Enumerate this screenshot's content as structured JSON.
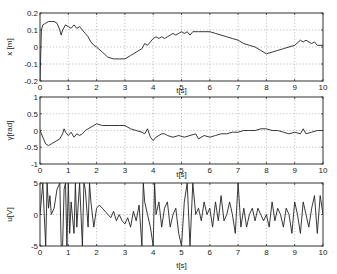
{
  "chart_data": [
    {
      "type": "line",
      "title": "",
      "xlabel": "t[s]",
      "ylabel": "x [m]",
      "xlim": [
        0,
        10
      ],
      "ylim": [
        -0.2,
        0.2
      ],
      "xticks": [
        0,
        1,
        2,
        3,
        4,
        5,
        6,
        7,
        8,
        9,
        10
      ],
      "yticks": [
        -0.2,
        -0.1,
        0,
        0.1,
        0.2
      ],
      "ytick_labels": [
        "-0.2",
        "-0.1",
        "0",
        "0.1",
        "0.2"
      ],
      "grid": true,
      "series": [
        {
          "name": "x",
          "x": [
            0,
            0.05,
            0.1,
            0.2,
            0.3,
            0.4,
            0.5,
            0.6,
            0.7,
            0.75,
            0.8,
            0.9,
            1.0,
            1.1,
            1.2,
            1.3,
            1.4,
            1.5,
            1.6,
            1.7,
            1.8,
            1.9,
            2.0,
            2.2,
            2.4,
            2.6,
            2.8,
            3.0,
            3.2,
            3.4,
            3.6,
            3.7,
            3.8,
            3.9,
            4.0,
            4.1,
            4.2,
            4.3,
            4.4,
            4.5,
            4.6,
            4.7,
            4.8,
            4.9,
            5.0,
            5.1,
            5.2,
            5.3,
            5.4,
            5.6,
            5.8,
            6.0,
            6.2,
            6.4,
            6.6,
            6.8,
            7.0,
            7.2,
            7.4,
            7.6,
            7.8,
            8.0,
            8.2,
            8.4,
            8.6,
            8.8,
            9.0,
            9.2,
            9.3,
            9.4,
            9.6,
            9.7,
            9.8,
            10.0
          ],
          "values": [
            -0.2,
            0.1,
            0.13,
            0.14,
            0.15,
            0.15,
            0.15,
            0.14,
            0.1,
            0.07,
            0.1,
            0.13,
            0.12,
            0.11,
            0.13,
            0.11,
            0.12,
            0.1,
            0.08,
            0.06,
            0.03,
            0.01,
            0.0,
            -0.03,
            -0.06,
            -0.07,
            -0.07,
            -0.07,
            -0.05,
            -0.03,
            -0.01,
            0.02,
            0.01,
            0.03,
            0.05,
            0.06,
            0.05,
            0.06,
            0.05,
            0.06,
            0.07,
            0.08,
            0.07,
            0.08,
            0.09,
            0.08,
            0.09,
            0.07,
            0.09,
            0.09,
            0.09,
            0.09,
            0.08,
            0.07,
            0.06,
            0.05,
            0.04,
            0.02,
            0.01,
            0.0,
            -0.02,
            -0.04,
            -0.03,
            -0.02,
            -0.01,
            0.0,
            0.01,
            0.04,
            0.03,
            0.04,
            0.02,
            0.03,
            0.01,
            0.01
          ]
        }
      ]
    },
    {
      "type": "line",
      "title": "",
      "xlabel": "t[s]",
      "ylabel": "γ[rad]",
      "xlim": [
        0,
        10
      ],
      "ylim": [
        -1,
        1
      ],
      "xticks": [
        0,
        1,
        2,
        3,
        4,
        5,
        6,
        7,
        8,
        9,
        10
      ],
      "yticks": [
        -1,
        -0.5,
        0,
        0.5,
        1
      ],
      "ytick_labels": [
        "-1",
        "-0.5",
        "0",
        "0.5",
        "1"
      ],
      "grid": true,
      "series": [
        {
          "name": "gamma",
          "x": [
            0,
            0.1,
            0.2,
            0.3,
            0.4,
            0.5,
            0.6,
            0.7,
            0.8,
            0.85,
            0.9,
            1.0,
            1.1,
            1.2,
            1.3,
            1.4,
            1.5,
            1.6,
            1.7,
            1.8,
            1.9,
            2.0,
            2.2,
            2.5,
            2.8,
            3.0,
            3.2,
            3.4,
            3.6,
            3.7,
            3.8,
            3.9,
            4.0,
            4.1,
            4.2,
            4.3,
            4.4,
            4.5,
            4.7,
            4.9,
            5.1,
            5.3,
            5.5,
            5.6,
            5.8,
            6.0,
            6.2,
            6.4,
            6.6,
            6.8,
            7.0,
            7.2,
            7.4,
            7.6,
            7.8,
            8.0,
            8.2,
            8.4,
            8.6,
            8.8,
            9.0,
            9.2,
            9.3,
            9.4,
            9.6,
            9.8,
            10.0
          ],
          "values": [
            0.0,
            -0.2,
            -0.4,
            -0.45,
            -0.4,
            -0.35,
            -0.3,
            -0.25,
            -0.1,
            0.05,
            -0.05,
            -0.15,
            -0.05,
            -0.2,
            -0.1,
            -0.15,
            -0.1,
            0.0,
            0.05,
            0.1,
            0.15,
            0.2,
            0.15,
            0.15,
            0.15,
            0.15,
            0.05,
            0.0,
            -0.05,
            -0.1,
            0.05,
            -0.2,
            -0.3,
            -0.2,
            -0.15,
            -0.1,
            -0.1,
            -0.15,
            -0.2,
            -0.15,
            -0.2,
            -0.15,
            -0.1,
            -0.25,
            -0.15,
            -0.2,
            -0.15,
            -0.1,
            -0.1,
            -0.05,
            -0.05,
            0.0,
            0.0,
            0.0,
            0.05,
            0.05,
            0.0,
            0.0,
            -0.05,
            -0.1,
            -0.05,
            -0.1,
            0.05,
            -0.1,
            -0.05,
            0.0,
            0.0
          ]
        }
      ]
    },
    {
      "type": "line",
      "title": "",
      "xlabel": "t[s]",
      "ylabel": "u[V]",
      "xlim": [
        0,
        10
      ],
      "ylim": [
        -5,
        5
      ],
      "xticks": [
        0,
        1,
        2,
        3,
        4,
        5,
        6,
        7,
        8,
        9,
        10
      ],
      "yticks": [
        -5,
        0,
        5
      ],
      "ytick_labels": [
        "-5",
        "0",
        "5"
      ],
      "grid": true,
      "series": [
        {
          "name": "u",
          "x": [
            0,
            0.1,
            0.2,
            0.25,
            0.3,
            0.35,
            0.4,
            0.5,
            0.6,
            0.7,
            0.75,
            0.8,
            0.85,
            0.9,
            0.95,
            1.0,
            1.05,
            1.1,
            1.2,
            1.25,
            1.3,
            1.4,
            1.5,
            1.55,
            1.6,
            1.7,
            1.75,
            1.8,
            1.9,
            2.0,
            2.1,
            2.2,
            2.3,
            2.4,
            2.5,
            2.6,
            2.7,
            2.8,
            2.9,
            3.0,
            3.1,
            3.2,
            3.3,
            3.4,
            3.5,
            3.6,
            3.65,
            3.7,
            3.8,
            3.9,
            4.0,
            4.05,
            4.1,
            4.2,
            4.3,
            4.4,
            4.5,
            4.6,
            4.7,
            4.8,
            4.9,
            5.0,
            5.1,
            5.2,
            5.3,
            5.4,
            5.5,
            5.6,
            5.7,
            5.8,
            5.9,
            6.0,
            6.1,
            6.2,
            6.3,
            6.4,
            6.5,
            6.6,
            6.7,
            6.8,
            6.9,
            7.0,
            7.1,
            7.2,
            7.3,
            7.4,
            7.5,
            7.6,
            7.7,
            7.8,
            7.9,
            8.0,
            8.1,
            8.2,
            8.3,
            8.4,
            8.5,
            8.6,
            8.7,
            8.8,
            8.9,
            9.0,
            9.1,
            9.2,
            9.3,
            9.4,
            9.5,
            9.6,
            9.7,
            9.8,
            9.9,
            10.0
          ],
          "values": [
            0,
            5,
            -5,
            5,
            1,
            3,
            0,
            1,
            4,
            5,
            -5,
            -5,
            4,
            5,
            -5,
            5,
            -3,
            2,
            -3,
            5,
            -2,
            5,
            -5,
            5,
            4,
            -2,
            5,
            2,
            -2,
            1,
            1.5,
            1,
            0.5,
            0,
            -0.5,
            0.5,
            -1,
            0,
            -1,
            -1.5,
            -0.5,
            -2,
            0.5,
            -1,
            1.5,
            -5,
            5,
            2,
            0,
            -2,
            -5,
            5,
            0,
            2,
            -2,
            1,
            2,
            -2,
            0,
            1,
            -3,
            -5,
            2,
            5,
            -5,
            5,
            0,
            1,
            -1,
            2,
            0,
            1,
            -2,
            2,
            -1,
            3,
            -1,
            0,
            2,
            0,
            -3,
            5,
            -2,
            1,
            -2,
            0,
            1,
            -1,
            1,
            0,
            -1,
            0,
            -2,
            2,
            -1,
            1,
            0,
            -2,
            1,
            0,
            -3,
            2,
            0,
            -3,
            2,
            0,
            -2,
            1,
            3,
            -3,
            3,
            0,
            0,
            0
          ]
        }
      ]
    }
  ],
  "figure": {
    "panels": [
      {
        "ylabel": "x [m]",
        "xlabel": "t[s]"
      },
      {
        "ylabel": "γ[rad]",
        "xlabel": "t[s]"
      },
      {
        "ylabel": "u[V]",
        "xlabel": "t[s]"
      }
    ]
  }
}
